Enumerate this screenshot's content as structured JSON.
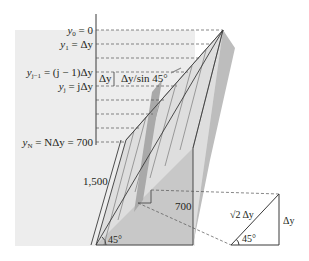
{
  "figure": {
    "type": "diagram",
    "colors": {
      "background_panel": "#ededed",
      "dam_body": "#c9c9c9",
      "dam_face_light": "#dcdcdc",
      "highlight_strip": "#a8a8a8",
      "line": "#3a3a3a",
      "dashed": "#555555"
    },
    "y_levels": [
      {
        "label_main": "y",
        "sub": "0",
        "rest": " = 0"
      },
      {
        "label_main": "y",
        "sub": "1",
        "rest": " = Δy"
      },
      {
        "label_main": "y",
        "sub": "j−1",
        "rest": " = (j − 1)Δy"
      },
      {
        "label_main": "y",
        "sub": "j",
        "rest": " = jΔy"
      },
      {
        "label_main": "y",
        "sub": "N",
        "rest": " = NΔy = 700"
      }
    ],
    "strip_labels": {
      "delta_y": "Δy",
      "slant_width": "Δy/sin 45°"
    },
    "dimensions": {
      "slant_length": "1,500",
      "height": "700",
      "angle": "45°"
    },
    "detail_triangle": {
      "hypotenuse": "√2 Δy",
      "vertical": "Δy",
      "angle": "45°"
    }
  }
}
